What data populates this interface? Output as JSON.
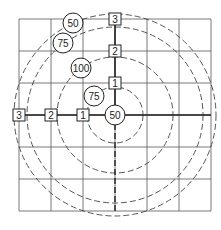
{
  "diagram": {
    "grid": {
      "x0": 19,
      "y0": 19,
      "cell": 32,
      "cols": 6,
      "rows": 6,
      "color": "#555555"
    },
    "center": {
      "x": 115,
      "y": 115
    },
    "dashed_circles": [
      28,
      58,
      88,
      101
    ],
    "square_markers": [
      {
        "label": "1",
        "x": 115,
        "y": 83
      },
      {
        "label": "2",
        "x": 115,
        "y": 51
      },
      {
        "label": "3",
        "x": 115,
        "y": 19
      },
      {
        "label": "1",
        "x": 83,
        "y": 115
      },
      {
        "label": "2",
        "x": 51,
        "y": 115
      },
      {
        "label": "3",
        "x": 19,
        "y": 115
      }
    ],
    "circle_markers": [
      {
        "label": "50",
        "x": 115,
        "y": 115
      },
      {
        "label": "75",
        "x": 94,
        "y": 96
      },
      {
        "label": "100",
        "x": 81,
        "y": 68
      },
      {
        "label": "75",
        "x": 63,
        "y": 43
      },
      {
        "label": "50",
        "x": 73,
        "y": 23
      }
    ]
  }
}
